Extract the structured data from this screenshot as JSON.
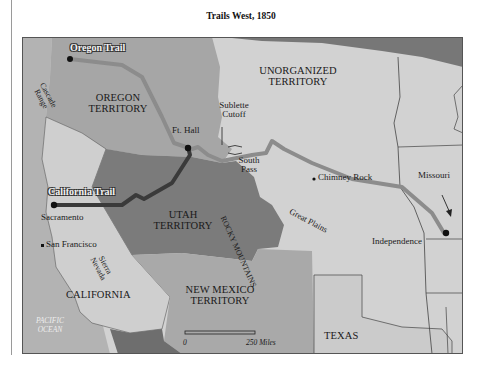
{
  "title": "Trails West, 1850",
  "colors": {
    "oregon_territory": "#a6a6a6",
    "unorganized_territory": "#d2d2d2",
    "utah_territory": "#7b7b7b",
    "california": "#cfcfcf",
    "new_mexico_territory": "#a9a9a9",
    "texas": "#cbcbcb",
    "states_east": "#d0d0d0",
    "ocean": "#b3b3b3",
    "canada_top_right": "#777777",
    "mexico_bottom": "#6e6e6e",
    "oregon_trail": "#8c8c8c",
    "california_trail": "#3a3a3a"
  },
  "territories": {
    "oregon": "OREGON TERRITORY",
    "unorganized": "UNORGANIZED TERRITORY",
    "utah": "UTAH TERRITORY",
    "california": "CALIFORNIA",
    "new_mexico": "NEW MEXICO TERRITORY",
    "texas": "TEXAS"
  },
  "trails": {
    "oregon": "Oregon Trail",
    "california": "California Trail"
  },
  "places": {
    "ft_hall": "Ft. Hall",
    "sublette_cutoff": "Sublette Cutoff",
    "south_pass": "South Pass",
    "chimney_rock": "Chimney Rock",
    "missouri": "Missouri",
    "independence": "Independence",
    "sacramento": "Sacramento",
    "san_francisco": "San Francisco"
  },
  "features": {
    "cascade_range": "Cascade Range",
    "sierra_nevada": "Sierra Nevada",
    "rocky_mountains": "ROCKY MOUNTAINS",
    "great_plains": "Great Plains",
    "pacific_ocean": "PACIFIC OCEAN"
  },
  "scale": {
    "start": "0",
    "end": "250 Miles"
  }
}
